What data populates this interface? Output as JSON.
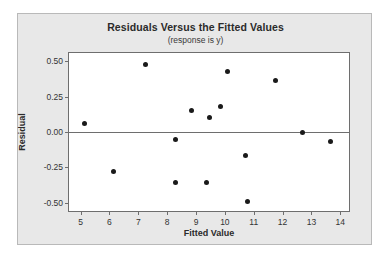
{
  "chart_data": {
    "type": "scatter",
    "title": "Residuals Versus the Fitted Values",
    "subtitle": "(response is y)",
    "xlabel": "Fitted Value",
    "ylabel": "Residual",
    "xlim": [
      4.6,
      14.3
    ],
    "ylim": [
      -0.56,
      0.56
    ],
    "xticks": [
      "5",
      "6",
      "7",
      "8",
      "9",
      "10",
      "11",
      "12",
      "13",
      "14"
    ],
    "xtick_values": [
      5,
      6,
      7,
      8,
      9,
      10,
      11,
      12,
      13,
      14
    ],
    "yticks": [
      "0.50",
      "0.25",
      "0.00",
      "-0.25",
      "-0.50"
    ],
    "ytick_values": [
      0.5,
      0.25,
      0,
      -0.25,
      -0.5
    ],
    "grid": false,
    "legend": false,
    "reference_line_y": 0,
    "marker_color": "#1a1a1a",
    "plot_bg": "#ffffff",
    "panel_bg": "#e8e8e8",
    "points": [
      {
        "x": 5.12,
        "y": 0.06
      },
      {
        "x": 6.15,
        "y": -0.28
      },
      {
        "x": 7.25,
        "y": 0.48
      },
      {
        "x": 8.28,
        "y": -0.05
      },
      {
        "x": 8.3,
        "y": -0.36
      },
      {
        "x": 8.85,
        "y": 0.155
      },
      {
        "x": 9.38,
        "y": -0.36
      },
      {
        "x": 9.45,
        "y": 0.1
      },
      {
        "x": 9.85,
        "y": 0.18
      },
      {
        "x": 10.08,
        "y": 0.43
      },
      {
        "x": 10.72,
        "y": -0.17
      },
      {
        "x": 10.78,
        "y": -0.49
      },
      {
        "x": 11.75,
        "y": 0.365
      },
      {
        "x": 12.7,
        "y": 0.0
      },
      {
        "x": 13.65,
        "y": -0.065
      }
    ]
  }
}
